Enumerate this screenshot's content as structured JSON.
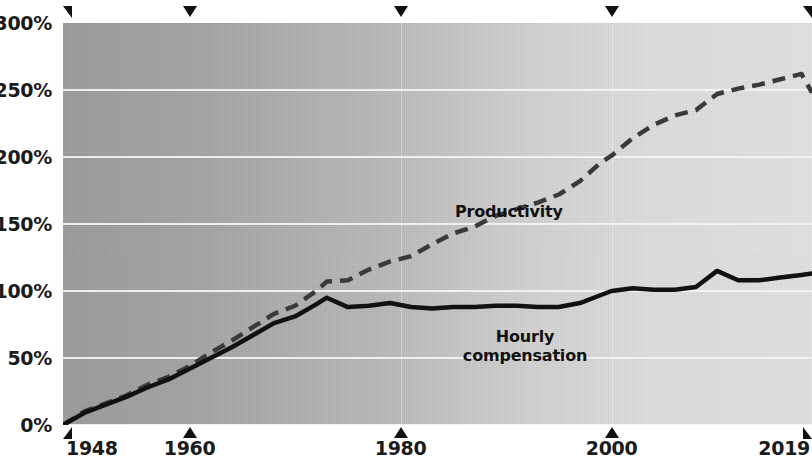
{
  "chart_data": {
    "type": "line",
    "title": "",
    "subtitle": "",
    "xlabel": "",
    "ylabel": "",
    "grid": true,
    "legend_position": "inline-annotation",
    "xlim": [
      1948,
      2019
    ],
    "ylim": [
      0,
      300
    ],
    "y_ticks": [
      0,
      50,
      100,
      150,
      200,
      250,
      300
    ],
    "y_tick_labels": [
      "0%",
      "50%",
      "100%",
      "150%",
      "200%",
      "250%",
      "300%"
    ],
    "x_ticks": [
      1948,
      1960,
      1980,
      2000,
      2019
    ],
    "x_tick_labels": [
      "1948",
      "1960",
      "1980",
      "2000",
      "2019"
    ],
    "annotations": [
      {
        "text": "Productivity",
        "x": 1983,
        "y": 162
      },
      {
        "text": "Hourly\ncompensation",
        "x": 1983,
        "y": 73
      }
    ],
    "x": [
      1948,
      1950,
      1952,
      1954,
      1956,
      1958,
      1960,
      1962,
      1964,
      1966,
      1968,
      1970,
      1972,
      1973,
      1975,
      1977,
      1979,
      1981,
      1983,
      1985,
      1987,
      1989,
      1991,
      1993,
      1995,
      1997,
      1999,
      2000,
      2002,
      2004,
      2006,
      2008,
      2010,
      2012,
      2014,
      2016,
      2018,
      2019
    ],
    "series": [
      {
        "name": "Productivity",
        "style": "dashed",
        "color": "#3a3a3a",
        "values": [
          0,
          10,
          16,
          22,
          30,
          36,
          44,
          54,
          63,
          73,
          83,
          89,
          100,
          107,
          108,
          116,
          122,
          126,
          135,
          143,
          148,
          156,
          161,
          166,
          172,
          182,
          196,
          201,
          214,
          224,
          231,
          235,
          247,
          251,
          254,
          258,
          262,
          248
        ]
      },
      {
        "name": "Hourly compensation",
        "style": "solid",
        "color": "#111111",
        "values": [
          0,
          9,
          15,
          21,
          28,
          34,
          42,
          50,
          58,
          67,
          76,
          81,
          90,
          95,
          88,
          89,
          91,
          88,
          87,
          88,
          88,
          89,
          89,
          88,
          88,
          91,
          97,
          100,
          102,
          101,
          101,
          103,
          115,
          108,
          108,
          110,
          112,
          113
        ]
      }
    ]
  },
  "axes": {
    "y_labels": [
      {
        "text": "300%",
        "value": 300
      },
      {
        "text": "250%",
        "value": 250
      },
      {
        "text": "200%",
        "value": 200
      },
      {
        "text": "150%",
        "value": 150
      },
      {
        "text": "100%",
        "value": 100
      },
      {
        "text": "50%",
        "value": 50
      },
      {
        "text": "0%",
        "value": 0
      }
    ],
    "x_labels": [
      {
        "text": "1948",
        "value": 1948
      },
      {
        "text": "1960",
        "value": 1960
      },
      {
        "text": "1980",
        "value": 1980
      },
      {
        "text": "2000",
        "value": 2000
      },
      {
        "text": "2019",
        "value": 2019
      }
    ]
  },
  "labels": {
    "productivity": "Productivity",
    "compensation": "Hourly\ncompensation"
  },
  "colors": {
    "productivity_line": "#3a3a3a",
    "compensation_line": "#111111",
    "gridline": "#f4f4f4",
    "plot_bg_left": "#9c9c9c",
    "plot_bg_right": "#e3e3e3",
    "text": "#1b1b1b"
  }
}
